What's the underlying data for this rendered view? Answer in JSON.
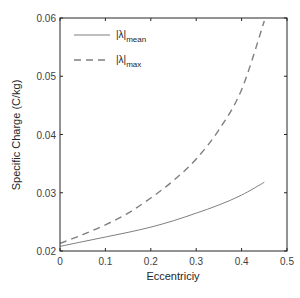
{
  "chart_data": {
    "type": "line",
    "title": "",
    "xlabel": "Eccentriciy",
    "ylabel": "Specific Charge (C/kg)",
    "xlim": [
      0,
      0.5
    ],
    "ylim": [
      0.02,
      0.06
    ],
    "xticks": [
      "0",
      "0.1",
      "0.2",
      "0.3",
      "0.4",
      "0.5"
    ],
    "yticks": [
      "0.02",
      "0.03",
      "0.04",
      "0.05",
      "0.06"
    ],
    "grid": false,
    "legend_position": "upper left",
    "series": [
      {
        "name": "|λ|mean",
        "legend_main": "|λ|",
        "legend_sub": "mean",
        "style": "solid",
        "color": "#7f7f7f",
        "x": [
          0,
          0.05,
          0.1,
          0.15,
          0.2,
          0.25,
          0.3,
          0.35,
          0.4,
          0.45
        ],
        "y": [
          0.0208,
          0.0216,
          0.0224,
          0.0232,
          0.0241,
          0.0252,
          0.0265,
          0.0279,
          0.0296,
          0.0318
        ]
      },
      {
        "name": "|λ|max",
        "legend_main": "|λ|",
        "legend_sub": "max",
        "style": "dashed",
        "color": "#7f7f7f",
        "x": [
          0,
          0.05,
          0.1,
          0.15,
          0.2,
          0.25,
          0.3,
          0.35,
          0.4,
          0.45
        ],
        "y": [
          0.0213,
          0.0228,
          0.0245,
          0.0265,
          0.0291,
          0.0321,
          0.0358,
          0.0408,
          0.0477,
          0.0595
        ]
      }
    ]
  }
}
